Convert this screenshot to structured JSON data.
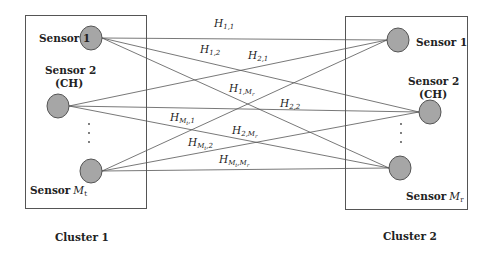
{
  "diagram": {
    "type": "MIMO cluster channel diagram",
    "clusters": [
      {
        "id": "cluster-1",
        "label": "Cluster 1",
        "sensors": [
          {
            "label": "Sensor 1"
          },
          {
            "label": "Sensor 2",
            "sublabel": "(CH)"
          },
          {
            "label": "Sensor",
            "var": "M",
            "var_sub": "t"
          }
        ]
      },
      {
        "id": "cluster-2",
        "label": "Cluster 2",
        "sensors": [
          {
            "label": "Sensor 1"
          },
          {
            "label": "Sensor 2",
            "sublabel": "(CH)"
          },
          {
            "label": "Sensor",
            "var": "M",
            "var_sub": "r"
          }
        ]
      }
    ],
    "channels": [
      {
        "base": "H",
        "sub": "1,1"
      },
      {
        "base": "H",
        "sub": "1,2"
      },
      {
        "base": "H",
        "sub": "2,1"
      },
      {
        "base": "H",
        "sub": "1,Mr"
      },
      {
        "base": "H",
        "sub": "2,2"
      },
      {
        "base": "H",
        "sub": "Mt,1"
      },
      {
        "base": "H",
        "sub": "2,Mr"
      },
      {
        "base": "H",
        "sub": "Mt,2"
      },
      {
        "base": "H",
        "sub": "Mt,Mr"
      }
    ],
    "colors": {
      "node_fill": "#a6a6a6",
      "stroke": "#555555",
      "text": "#222222"
    }
  }
}
